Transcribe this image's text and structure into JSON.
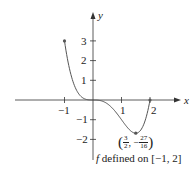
{
  "chart_data": {
    "type": "line",
    "title": "",
    "function": "f(x) = x^4 - 2x^3",
    "xlabel": "x",
    "ylabel": "y",
    "xlim": [
      -2.7,
      3.0
    ],
    "ylim": [
      -3.1,
      4.5
    ],
    "x_ticks": [
      -1,
      1,
      2
    ],
    "y_ticks": [
      -2,
      -1,
      1,
      2,
      3
    ],
    "x_tick_labels": [
      "−1",
      "1",
      "2"
    ],
    "y_tick_labels": [
      "−2",
      "−1",
      "1",
      "2",
      "3"
    ],
    "grid": false,
    "legend": null,
    "x": [
      -1,
      -0.75,
      -0.5,
      -0.25,
      0,
      0.25,
      0.5,
      0.75,
      1,
      1.25,
      1.5,
      1.75,
      2
    ],
    "values": [
      3,
      1.16,
      0.31,
      0.035,
      0,
      -0.027,
      -0.19,
      -0.53,
      -1,
      -1.46,
      -1.6875,
      -1.35,
      0
    ],
    "marked_points": [
      {
        "x": -1,
        "y": 3
      },
      {
        "x": 1.5,
        "y": -1.6875,
        "label": "(3/2, −27/16)"
      },
      {
        "x": 2,
        "y": 0
      }
    ],
    "annotations": [
      "(3/2, −27/16)",
      "f defined on [−1, 2]"
    ]
  },
  "labels": {
    "x_axis": "x",
    "y_axis": "y",
    "min_point": {
      "open": "(",
      "num1": "3",
      "den1": "2",
      "comma": ", −",
      "num2": "27",
      "den2": "16",
      "close": ")"
    },
    "domain_note_f": "f",
    "domain_note_rest": " defined on [−1, 2]"
  },
  "colors": {
    "axis": "#333333",
    "curve": "#555555",
    "text": "#222222"
  }
}
